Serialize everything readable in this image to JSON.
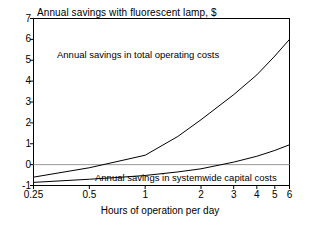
{
  "chart_data": {
    "type": "line",
    "title": "Annual savings with fluorescent lamp, $",
    "xlabel": "Hours of operation per day",
    "ylabel": "",
    "xscale": "log",
    "xlim": [
      0.25,
      6
    ],
    "ylim": [
      -1,
      7
    ],
    "grid": false,
    "zero_line": true,
    "legend_position": "inline-annotations",
    "xticks": [
      "0.25",
      "0.5",
      "1",
      "2",
      "3",
      "4",
      "5",
      "6"
    ],
    "xtick_values": [
      0.25,
      0.5,
      1,
      2,
      3,
      4,
      5,
      6
    ],
    "yticks": [
      "7",
      "6",
      "5",
      "4",
      "3",
      "2",
      "1",
      "0",
      "-1"
    ],
    "ytick_values": [
      7,
      6,
      5,
      4,
      3,
      2,
      1,
      0,
      -1
    ],
    "series": [
      {
        "name": "Annual savings in total operating costs",
        "annotation": "Annual savings in total operating costs",
        "x": [
          0.25,
          0.5,
          0.75,
          1.0,
          1.5,
          2.0,
          3.0,
          4.0,
          5.0,
          6.0
        ],
        "values": [
          -0.6,
          -0.15,
          0.2,
          0.45,
          1.35,
          2.15,
          3.35,
          4.3,
          5.2,
          6.0
        ]
      },
      {
        "name": "Annual savings in systemwide capital costs",
        "annotation": "Annual savings in systemwide capital costs",
        "x": [
          0.25,
          0.5,
          0.75,
          1.0,
          1.5,
          2.0,
          3.0,
          4.0,
          5.0,
          6.0
        ],
        "values": [
          -0.85,
          -0.7,
          -0.6,
          -0.52,
          -0.35,
          -0.2,
          0.12,
          0.4,
          0.68,
          0.95
        ]
      }
    ],
    "colors": {
      "line": "#000000",
      "axis": "#000000",
      "zero_line": "#999999",
      "background": "#ffffff"
    }
  }
}
